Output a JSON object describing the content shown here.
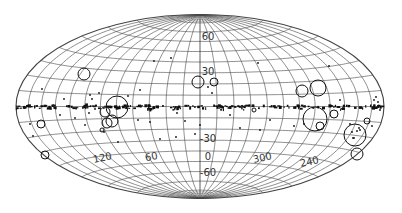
{
  "figure": {
    "type": "all-sky map",
    "projection": "Hammer-Aitoff equal-area",
    "coordinate_system": "galactic",
    "background_color": "#ffffff",
    "line_color": "#444444",
    "marker_color": "#111111",
    "ellipse": {
      "cx": 200,
      "cy": 106.5,
      "rx": 184,
      "ry": 92
    },
    "grid": {
      "longitude_step_deg": 15,
      "latitude_step_deg": 10
    }
  },
  "labels": {
    "latitude": [
      {
        "text": "60",
        "lon": 0,
        "lat": 60
      },
      {
        "text": "30",
        "lon": 0,
        "lat": 30
      },
      {
        "text": "-30",
        "lon": 0,
        "lat": -30
      },
      {
        "text": "0",
        "lon": 0,
        "lat": -45
      },
      {
        "text": "-60",
        "lon": 0,
        "lat": -60
      }
    ],
    "longitude": [
      {
        "text": "120",
        "lon": 120,
        "lat": -40
      },
      {
        "text": "60",
        "lon": 60,
        "lat": -40
      },
      {
        "text": "300",
        "lon": -60,
        "lat": -40
      },
      {
        "text": "240",
        "lon": -120,
        "lat": -40
      }
    ]
  },
  "large_circles": [
    {
      "x": 84,
      "y": 74,
      "r": 6
    },
    {
      "x": 198,
      "y": 82,
      "r": 6
    },
    {
      "x": 214,
      "y": 82,
      "r": 4
    },
    {
      "x": 117,
      "y": 107,
      "r": 11
    },
    {
      "x": 105,
      "y": 112,
      "r": 5
    },
    {
      "x": 112,
      "y": 121,
      "r": 6
    },
    {
      "x": 107,
      "y": 123,
      "r": 5
    },
    {
      "x": 41,
      "y": 124,
      "r": 4
    },
    {
      "x": 102,
      "y": 130,
      "r": 2
    },
    {
      "x": 302,
      "y": 91,
      "r": 6
    },
    {
      "x": 318,
      "y": 88,
      "r": 8
    },
    {
      "x": 254,
      "y": 110,
      "r": 2
    },
    {
      "x": 315,
      "y": 119,
      "r": 12
    },
    {
      "x": 334,
      "y": 114,
      "r": 4
    },
    {
      "x": 367,
      "y": 121,
      "r": 3
    },
    {
      "x": 320,
      "y": 126,
      "r": 4
    },
    {
      "x": 355,
      "y": 135,
      "r": 11
    },
    {
      "x": 357,
      "y": 154,
      "r": 6
    },
    {
      "x": 45,
      "y": 155,
      "r": 4
    }
  ],
  "small_markers": [
    [
      171,
      58
    ],
    [
      154,
      61
    ],
    [
      99,
      93
    ],
    [
      90,
      95
    ],
    [
      92,
      99
    ],
    [
      208,
      87
    ],
    [
      212,
      93
    ],
    [
      42,
      89
    ],
    [
      64,
      99
    ],
    [
      128,
      96
    ],
    [
      177,
      113
    ],
    [
      185,
      121
    ],
    [
      195,
      134
    ],
    [
      176,
      137
    ],
    [
      160,
      139
    ],
    [
      104,
      132
    ],
    [
      118,
      142
    ],
    [
      33,
      136
    ],
    [
      30,
      124
    ],
    [
      280,
      108
    ],
    [
      340,
      100
    ],
    [
      270,
      120
    ],
    [
      294,
      126
    ],
    [
      304,
      124
    ],
    [
      350,
      124
    ],
    [
      360,
      130
    ],
    [
      353,
      138
    ],
    [
      372,
      126
    ],
    [
      380,
      110
    ],
    [
      260,
      130
    ],
    [
      230,
      115
    ],
    [
      240,
      128
    ],
    [
      200,
      125
    ],
    [
      150,
      122
    ],
    [
      138,
      120
    ],
    [
      60,
      115
    ],
    [
      75,
      118
    ],
    [
      85,
      125
    ],
    [
      95,
      109
    ],
    [
      89,
      113
    ],
    [
      140,
      90
    ],
    [
      219,
      108
    ],
    [
      374,
      100
    ],
    [
      258,
      63
    ],
    [
      329,
      66
    ],
    [
      376,
      97
    ],
    [
      378,
      102
    ]
  ],
  "equator_band": {
    "description": "dense chain of small sources along galactic plane (b≈0)",
    "y": 107,
    "x_start": 18,
    "x_end": 382
  }
}
